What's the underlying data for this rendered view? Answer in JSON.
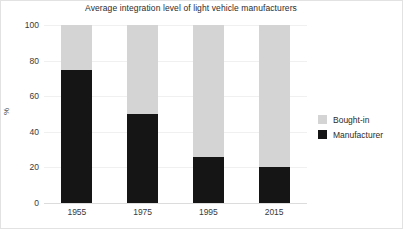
{
  "chart_data": {
    "type": "bar",
    "subtype": "stacked-bar",
    "title": "Average integration level of light vehicle manufacturers",
    "xlabel": "",
    "ylabel": "%",
    "categories": [
      "1955",
      "1975",
      "1995",
      "2015"
    ],
    "ylim": [
      0,
      100
    ],
    "yticks": [
      0,
      20,
      40,
      60,
      80,
      100
    ],
    "ytick_labels": [
      "0",
      "20",
      "40",
      "60",
      "80",
      "100"
    ],
    "grid": true,
    "legend_position": "right",
    "series": [
      {
        "name": "Manufacturer",
        "color": "#151515",
        "values": [
          75,
          50,
          26,
          20
        ]
      },
      {
        "name": "Bought-in",
        "color": "#d4d4d4",
        "values": [
          25,
          50,
          74,
          80
        ]
      }
    ],
    "legend": [
      {
        "label": "Bought-in",
        "color": "#d4d4d4"
      },
      {
        "label": "Manufacturer",
        "color": "#151515"
      }
    ]
  }
}
